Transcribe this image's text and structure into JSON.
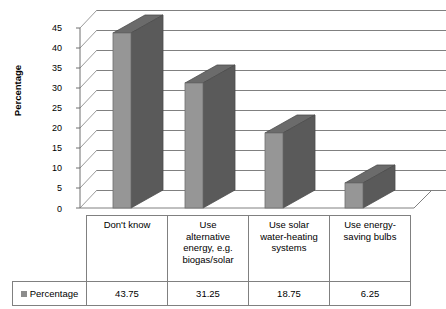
{
  "chart_data": {
    "type": "bar",
    "title": "",
    "xlabel": "",
    "ylabel": "Percentage",
    "categories": [
      "Don't know",
      "Use alternative energy, e.g. biogas/solar",
      "Use solar water-heating systems",
      "Use energy-saving bulbs"
    ],
    "values": [
      43.75,
      31.25,
      18.75,
      6.25
    ],
    "value_labels": [
      "43.75",
      "31.25",
      "18.75",
      "6.25"
    ],
    "series": [
      {
        "name": "Percentage",
        "values": [
          43.75,
          31.25,
          18.75,
          6.25
        ]
      }
    ],
    "ylim": [
      0,
      45
    ],
    "ytick_values": [
      0,
      5,
      10,
      15,
      20,
      25,
      30,
      35,
      40,
      45
    ],
    "ytick_labels": [
      "0",
      "5",
      "10",
      "15",
      "20",
      "25",
      "30",
      "35",
      "40",
      "45"
    ],
    "grid": true,
    "legend_position": "data-table",
    "three_d": true,
    "colors": {
      "bar_front": "#969696",
      "bar_top": "#6b6b6b",
      "bar_side": "#5a5a5a",
      "gridline": "#808080",
      "axis": "#6e6e6e",
      "table_border": "#808080",
      "legend_swatch": "#8c8c8c"
    }
  },
  "axis": {
    "y_title": "Percentage"
  },
  "table": {
    "legend_label": "Percentage",
    "category_row": [
      "Don't know",
      "Use alternative energy, e.g. biogas/solar",
      "Use solar water-heating systems",
      "Use energy-saving bulbs"
    ],
    "category_row_wrapped": [
      "Don't know",
      "Use\nalternative\nenergy, e.g.\nbiogas/solar",
      "Use solar\nwater-heating\nsystems",
      "Use energy-\nsaving bulbs"
    ],
    "value_row": [
      "43.75",
      "31.25",
      "18.75",
      "6.25"
    ]
  }
}
